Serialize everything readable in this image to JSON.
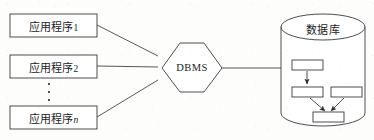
{
  "figure": {
    "type": "architecture-diagram",
    "background_color": "#fdfdfc",
    "line_color": "#3a3a3a",
    "text_color": "#1c1c1c"
  },
  "applications": {
    "boxes": [
      {
        "id": "app-1",
        "text_main": "应用程序",
        "index": "1",
        "index_italic": false
      },
      {
        "id": "app-2",
        "text_main": "应用程序",
        "index": "2",
        "index_italic": false
      },
      {
        "id": "app-n",
        "text_main": "应用程序",
        "index": "n",
        "index_italic": true
      }
    ],
    "ellipsis": "⋮"
  },
  "dbms": {
    "label": "DBMS",
    "shape": "hexagon"
  },
  "database": {
    "label": "数据库",
    "shape": "cylinder",
    "inner_nodes": [
      {
        "id": "node-top"
      },
      {
        "id": "node-mid-left"
      },
      {
        "id": "node-mid-right"
      },
      {
        "id": "node-bottom"
      }
    ],
    "inner_arrows": [
      {
        "from": "node-top",
        "to": "node-mid-left"
      },
      {
        "from": "node-mid-left",
        "to": "node-bottom"
      },
      {
        "from": "node-mid-right",
        "to": "node-bottom"
      }
    ]
  },
  "connectors": [
    {
      "from": "app-1",
      "to": "dbms"
    },
    {
      "from": "app-2",
      "to": "dbms"
    },
    {
      "from": "app-n",
      "to": "dbms"
    },
    {
      "from": "dbms",
      "to": "database"
    }
  ]
}
